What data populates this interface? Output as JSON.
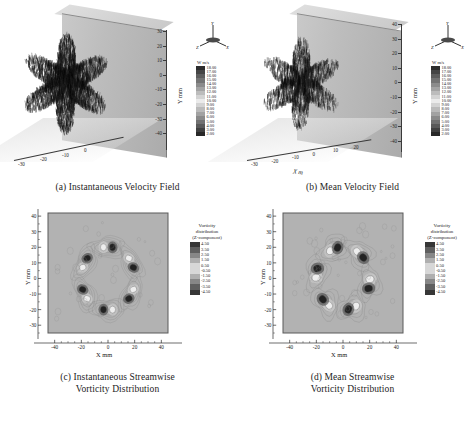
{
  "figure": {
    "panel_count": 4,
    "background": "#ffffff"
  },
  "panels": [
    {
      "id": "a",
      "caption": "(a) Instantaneous Velocity Field",
      "type": "3d-vector-field",
      "y_axis_label": "Y mm",
      "x_axis_label": "",
      "y_ticks": [
        "30",
        "20",
        "10",
        "0",
        "-10",
        "-20",
        "-30",
        "-40"
      ],
      "x_ticks": [
        "-30",
        "-20",
        "-10",
        "0"
      ],
      "triad": {
        "up": "Y",
        "left": "Z",
        "right": "X"
      },
      "colorbar": {
        "title": "W m/s",
        "values": [
          "18.00",
          "17.00",
          "16.00",
          "15.00",
          "14.00",
          "13.00",
          "12.00",
          "11.00",
          "10.00",
          "9.00",
          "8.00",
          "7.00",
          "6.00",
          "5.00",
          "4.00",
          "3.00",
          "2.00"
        ]
      }
    },
    {
      "id": "b",
      "caption": "(b) Mean Velocity Field",
      "type": "3d-vector-field",
      "y_axis_label": "Y mm",
      "x_axis_label": "X m",
      "y_ticks": [
        "40",
        "30",
        "20",
        "10",
        "0",
        "-10",
        "-20",
        "-30",
        "-40"
      ],
      "x_ticks": [
        "-30",
        "-20",
        "-10",
        "0",
        "10",
        "20"
      ],
      "triad": {
        "up": "Y",
        "left": "Z",
        "right": "X"
      },
      "colorbar": {
        "title": "W m/s",
        "values": [
          "18.00",
          "17.00",
          "16.00",
          "15.00",
          "14.00",
          "13.00",
          "12.00",
          "11.00",
          "10.00",
          "9.00",
          "8.00",
          "7.00",
          "6.00",
          "5.00",
          "4.00",
          "3.00",
          "2.00"
        ]
      }
    },
    {
      "id": "c",
      "caption_line1": "(c) Instantaneous Streamwise",
      "caption_line2": "Vorticity Distribution",
      "type": "contour",
      "x_axis_label": "X mm",
      "y_axis_label": "Y mm",
      "x_ticks": [
        "-40",
        "-20",
        "0",
        "20",
        "40"
      ],
      "y_ticks": [
        "40",
        "30",
        "20",
        "10",
        "0",
        "-10",
        "-20",
        "-30"
      ],
      "colorbar": {
        "title_line1": "Vorticity",
        "title_line2": "distribution",
        "title_line3": "(Z-component)",
        "values": [
          "4.50",
          "3.50",
          "2.50",
          "1.50",
          "0.50",
          "-0.50",
          "-1.50",
          "-2.50",
          "-3.50",
          "-4.50"
        ]
      }
    },
    {
      "id": "d",
      "caption_line1": "(d) Mean Streamwise",
      "caption_line2": "Vorticity Distribution",
      "type": "contour",
      "x_axis_label": "X mm",
      "y_axis_label": "Y mm",
      "x_ticks": [
        "-40",
        "-20",
        "0",
        "20",
        "40"
      ],
      "y_ticks": [
        "40",
        "30",
        "20",
        "10",
        "0",
        "-10",
        "-20",
        "-30"
      ],
      "colorbar": {
        "title_line1": "Vorticity",
        "title_line2": "distribution",
        "title_line3": "(Z-component)",
        "values": [
          "4.50",
          "3.50",
          "2.50",
          "1.50",
          "0.50",
          "-0.50",
          "-1.50",
          "-2.50",
          "-3.50",
          "-4.50"
        ]
      }
    }
  ],
  "chart_data": {
    "type": "heatmap",
    "title": "",
    "subplots": [
      {
        "id": "a",
        "type": "scatter",
        "title": "(a) Instantaneous Velocity Field",
        "xlabel": "",
        "ylabel": "Y mm",
        "zlabel": "W m/s",
        "ylim": [
          -40,
          35
        ],
        "xlim": [
          -35,
          5
        ],
        "colorbar_range": [
          2.0,
          18.0
        ],
        "colorbar_step": 1.0,
        "colorbar_levels": [
          18.0,
          17.0,
          16.0,
          15.0,
          14.0,
          13.0,
          12.0,
          11.0,
          10.0,
          9.0,
          8.0,
          7.0,
          6.0,
          5.0,
          4.0,
          3.0,
          2.0
        ],
        "description": "Three-dimensional instantaneous velocity vector field rendered over a vertical measurement plane, six-lobed star-shaped jet cross-section"
      },
      {
        "id": "b",
        "type": "scatter",
        "title": "(b) Mean Velocity Field",
        "xlabel": "X m",
        "ylabel": "Y mm",
        "zlabel": "W m/s",
        "ylim": [
          -40,
          40
        ],
        "xlim": [
          -35,
          25
        ],
        "colorbar_range": [
          2.0,
          18.0
        ],
        "colorbar_step": 1.0,
        "colorbar_levels": [
          18.0,
          17.0,
          16.0,
          15.0,
          14.0,
          13.0,
          12.0,
          11.0,
          10.0,
          9.0,
          8.0,
          7.0,
          6.0,
          5.0,
          4.0,
          3.0,
          2.0
        ],
        "description": "Three-dimensional mean (time-averaged) velocity vector field, smoother six-lobed star-shaped jet cross-section"
      },
      {
        "id": "c",
        "type": "heatmap",
        "title": "(c) Instantaneous Streamwise Vorticity Distribution",
        "xlabel": "X mm",
        "ylabel": "Y mm",
        "xlim": [
          -45,
          45
        ],
        "ylim": [
          -35,
          42
        ],
        "xticks": [
          -40,
          -20,
          0,
          20,
          40
        ],
        "yticks": [
          40,
          30,
          20,
          10,
          0,
          -10,
          -20,
          -30
        ],
        "colorbar_label": "Vorticity distribution (Z-component)",
        "colorbar_range": [
          -4.5,
          4.5
        ],
        "colorbar_step": 1.0,
        "colorbar_levels": [
          4.5,
          3.5,
          2.5,
          1.5,
          0.5,
          -0.5,
          -1.5,
          -2.5,
          -3.5,
          -4.5
        ],
        "lobe_count": 6,
        "lobe_centers": [
          [
            0,
            22
          ],
          [
            20,
            9
          ],
          [
            20,
            -13
          ],
          [
            0,
            -22
          ],
          [
            -20,
            -11
          ],
          [
            -20,
            7
          ]
        ],
        "description": "Instantaneous streamwise vorticity contours showing six counter-rotating vortex pairs arranged radially around the jet axis"
      },
      {
        "id": "d",
        "type": "heatmap",
        "title": "(d) Mean Streamwise Vorticity Distribution",
        "xlabel": "X mm",
        "ylabel": "Y mm",
        "xlim": [
          -45,
          45
        ],
        "ylim": [
          -35,
          42
        ],
        "xticks": [
          -40,
          -20,
          0,
          20,
          40
        ],
        "yticks": [
          40,
          30,
          20,
          10,
          0,
          -10,
          -20,
          -30
        ],
        "colorbar_label": "Vorticity distribution (Z-component)",
        "colorbar_range": [
          -4.5,
          4.5
        ],
        "colorbar_step": 1.0,
        "colorbar_levels": [
          4.5,
          3.5,
          2.5,
          1.5,
          0.5,
          -0.5,
          -1.5,
          -2.5,
          -3.5,
          -4.5
        ],
        "lobe_count": 6,
        "lobe_centers": [
          [
            -10,
            20
          ],
          [
            14,
            17
          ],
          [
            22,
            -2
          ],
          [
            12,
            -22
          ],
          [
            -13,
            -20
          ],
          [
            -22,
            0
          ]
        ],
        "description": "Mean streamwise vorticity contours showing six compact counter-rotating vortex pairs arranged radially around the jet axis"
      }
    ]
  }
}
